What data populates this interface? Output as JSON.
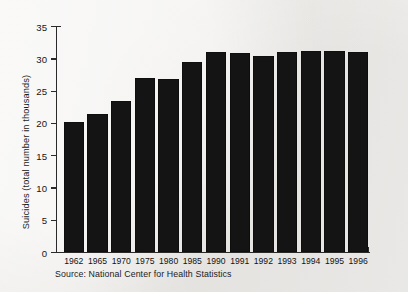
{
  "chart_data": {
    "type": "bar",
    "title": "",
    "xlabel": "",
    "ylabel": "Suicides (total number in thousands)",
    "categories": [
      "1962",
      "1965",
      "1970",
      "1975",
      "1980",
      "1985",
      "1990",
      "1991",
      "1992",
      "1993",
      "1994",
      "1995",
      "1996"
    ],
    "values": [
      20.1,
      21.3,
      23.4,
      27.0,
      26.8,
      29.5,
      30.9,
      30.8,
      30.3,
      31.0,
      31.1,
      31.2,
      30.9
    ],
    "ylim": [
      0,
      35
    ],
    "yticks": [
      0,
      5,
      10,
      15,
      20,
      25,
      30,
      35
    ],
    "ytick_labels": [
      "0",
      "5",
      "10",
      "15",
      "20",
      "25",
      "30",
      "35"
    ],
    "grid": false,
    "legend": null,
    "bar_color": "#141414",
    "background_color": "#efeeec"
  },
  "caption": {
    "source": "Source: National Center for Health Statistics"
  }
}
